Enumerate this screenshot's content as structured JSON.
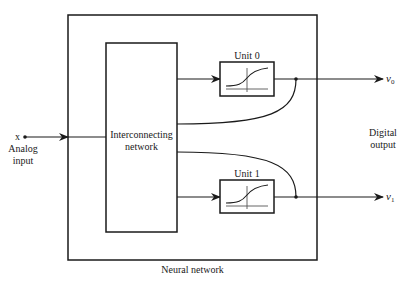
{
  "diagram": {
    "title": "Neural network",
    "outer_box_label": "Neural network",
    "input": {
      "symbol": "x",
      "label_line1": "Analog",
      "label_line2": "input"
    },
    "interconnect": {
      "label_line1": "Interconnecting",
      "label_line2": "network"
    },
    "units": [
      {
        "label": "Unit 0",
        "output_symbol": "v",
        "output_subscript": "0"
      },
      {
        "label": "Unit 1",
        "output_symbol": "v",
        "output_subscript": "1"
      }
    ],
    "output": {
      "label_line1": "Digital",
      "label_line2": "output"
    },
    "colors": {
      "stroke": "#1a1a1a",
      "curve_axis": "#555555",
      "background": "#ffffff"
    }
  }
}
